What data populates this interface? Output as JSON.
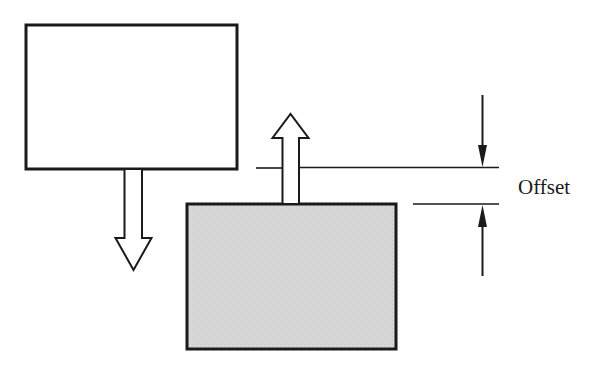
{
  "diagram": {
    "type": "offset-illustration",
    "colors": {
      "stroke": "#1a1a1a",
      "upper_box_fill": "#ffffff",
      "lower_box_fill": "#d6d6d6",
      "background": "#ffffff"
    },
    "elements": {
      "upper_box": {
        "x": 25,
        "y": 24,
        "w": 213,
        "h": 146,
        "fill": "white"
      },
      "lower_box": {
        "x": 186,
        "y": 204,
        "w": 211,
        "h": 146,
        "fill": "gray"
      },
      "down_arrow": {
        "direction": "down",
        "from": "upper_box"
      },
      "up_arrow": {
        "direction": "up",
        "from": "lower_box"
      },
      "dimension": {
        "label": "Offset"
      }
    }
  }
}
